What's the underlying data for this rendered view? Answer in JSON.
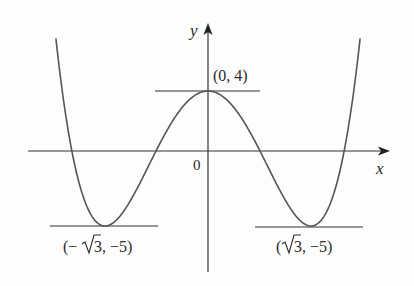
{
  "chart_data": {
    "type": "line",
    "title": "",
    "function": "y = x^4 - 6x^2 + 4",
    "xlabel": "x",
    "ylabel": "y",
    "origin_label": "0",
    "grid": false,
    "xlim": [
      -2.6,
      2.6
    ],
    "ylim": [
      -5.5,
      8
    ],
    "series": [
      {
        "name": "f(x)",
        "points": [
          [
            -2.58,
            7.37
          ],
          [
            -2.4,
            1.62
          ],
          [
            -2.29,
            0
          ],
          [
            -2.0,
            -4.0
          ],
          [
            -1.732,
            -5.0
          ],
          [
            -1.4,
            -3.92
          ],
          [
            -1.0,
            -1.0
          ],
          [
            -0.874,
            0
          ],
          [
            -0.5,
            2.56
          ],
          [
            0,
            4.0
          ],
          [
            0.5,
            2.56
          ],
          [
            0.874,
            0
          ],
          [
            1.0,
            -1.0
          ],
          [
            1.4,
            -3.92
          ],
          [
            1.732,
            -5.0
          ],
          [
            2.0,
            -4.0
          ],
          [
            2.29,
            0
          ],
          [
            2.4,
            1.62
          ],
          [
            2.58,
            7.37
          ]
        ]
      }
    ],
    "annotations": [
      {
        "label": "(0, 4)",
        "x": 0,
        "y": 4,
        "type": "local maximum",
        "horizontal_tangent": true
      },
      {
        "label": "(−√3, −5)",
        "x": -1.732,
        "y": -5,
        "type": "local minimum",
        "horizontal_tangent": true
      },
      {
        "label": "(√3, −5)",
        "x": 1.732,
        "y": -5,
        "type": "local minimum",
        "horizontal_tangent": true
      }
    ]
  },
  "labels": {
    "y_axis": "y",
    "x_axis": "x",
    "origin": "0",
    "max_point": "(0, 4)",
    "left_min_open": "(−",
    "left_min_num": "3, −5)",
    "right_min_open": "(",
    "right_min_num": "3, −5)"
  },
  "colors": {
    "curve": "#555555",
    "axes": "#333333",
    "text": "#2a2a2a",
    "background": "#fdfdfd"
  }
}
